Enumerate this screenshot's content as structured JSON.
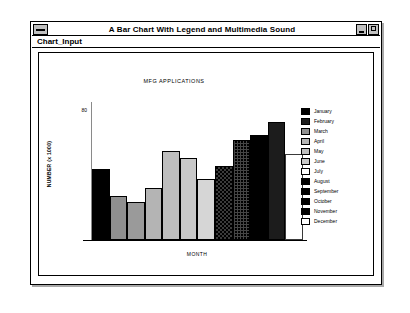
{
  "window": {
    "title": "A Bar Chart With Legend and Multimedia Sound",
    "sys_menu_icon": "system-menu-icon",
    "minimize_icon": "minimize-icon",
    "maximize_icon": "maximize-icon",
    "menu": [
      {
        "label": "Chart_Input"
      }
    ]
  },
  "chart_data": {
    "type": "bar",
    "title": "MFG APPLICATIONS",
    "xlabel": "MONTH",
    "ylabel": "NUMBER (x 1000)",
    "ylim": [
      0,
      88
    ],
    "yticks": [
      "80"
    ],
    "ytick_values": [
      80
    ],
    "grid": false,
    "legend_position": "right",
    "categories": [
      "January",
      "February",
      "March",
      "April",
      "May",
      "June",
      "July",
      "August",
      "September",
      "October",
      "November",
      "December"
    ],
    "values": [
      45,
      28,
      24,
      33,
      57,
      52,
      39,
      47,
      64,
      67,
      75,
      55
    ],
    "bar_styles": [
      "fill-solid-black",
      "fill-mid-gray",
      "fill-gray2",
      "fill-light-gray",
      "fill-light-gray2",
      "fill-lighter",
      "fill-lightest",
      "fill-dither-dark",
      "fill-dither-dark2",
      "fill-solid-black",
      "fill-dark-gray",
      "fill-white"
    ],
    "legend": [
      {
        "label": "January",
        "style": "fill-solid-black"
      },
      {
        "label": "February",
        "style": "fill-dark-gray"
      },
      {
        "label": "March",
        "style": "fill-mid-gray"
      },
      {
        "label": "April",
        "style": "fill-light-gray"
      },
      {
        "label": "May",
        "style": "fill-light-gray2"
      },
      {
        "label": "June",
        "style": "fill-lighter"
      },
      {
        "label": "July",
        "style": "fill-white"
      },
      {
        "label": "August",
        "style": "fill-solid-black"
      },
      {
        "label": "September",
        "style": "fill-solid-black"
      },
      {
        "label": "October",
        "style": "fill-solid-black"
      },
      {
        "label": "November",
        "style": "fill-solid-black"
      },
      {
        "label": "December",
        "style": "fill-white"
      }
    ]
  },
  "colors": {
    "window_border": "#000000",
    "title_bar_bg": "#ffffff",
    "client_bg": "#ffffff",
    "axis": "#000000",
    "button_face": "#c0c0c0"
  }
}
